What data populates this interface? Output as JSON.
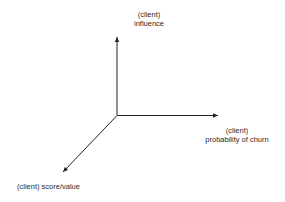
{
  "diagram": {
    "type": "3d-axes",
    "axes": {
      "vertical": {
        "line1": "(client)",
        "line2": "influence"
      },
      "horizontal": {
        "line1": "(client)",
        "line2": "probability of churn"
      },
      "diagonal": {
        "label": "(client) score/value"
      }
    },
    "colors": {
      "axis": "#222222",
      "text": "#2a2a2a",
      "background": "#ffffff"
    }
  }
}
